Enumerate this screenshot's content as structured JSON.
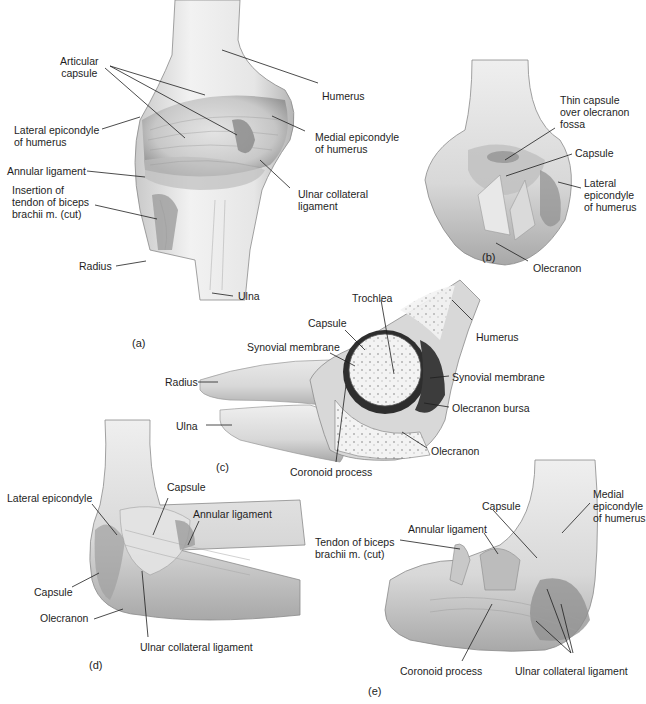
{
  "figure": {
    "panels": [
      {
        "id": "a",
        "tag": "(a)",
        "labels": [
          {
            "text": "Articular\ncapsule",
            "x": 60,
            "y": 55,
            "align": "center"
          },
          {
            "text": "Humerus",
            "x": 342,
            "y": 96
          },
          {
            "text": "Lateral epicondyle\nof humerus",
            "x": 14,
            "y": 124
          },
          {
            "text": "Medial epicondyle\nof humerus",
            "x": 315,
            "y": 114
          },
          {
            "text": "Annular ligament",
            "x": 7,
            "y": 166
          },
          {
            "text": "Insertion of\ntendon of biceps\nbrachii m. (cut)",
            "x": 12,
            "y": 183
          },
          {
            "text": "Ulnar collateral\nligament",
            "x": 298,
            "y": 183
          },
          {
            "text": "Radius",
            "x": 79,
            "y": 260
          },
          {
            "text": "Ulna",
            "x": 238,
            "y": 292
          }
        ]
      },
      {
        "id": "b",
        "tag": "(b)",
        "labels": [
          {
            "text": "Thin capsule\nover olecranon\nfossa",
            "x": 560,
            "y": 94
          },
          {
            "text": "Capsule",
            "x": 575,
            "y": 148
          },
          {
            "text": "Lateral\nepicondyle\nof humerus",
            "x": 584,
            "y": 177
          },
          {
            "text": "Olecranon",
            "x": 535,
            "y": 263
          }
        ]
      },
      {
        "id": "c",
        "tag": "(c)",
        "labels": [
          {
            "text": "Trochlea",
            "x": 352,
            "y": 292
          },
          {
            "text": "Capsule",
            "x": 308,
            "y": 316
          },
          {
            "text": "Humerus",
            "x": 476,
            "y": 331
          },
          {
            "text": "Synovial membrane",
            "x": 247,
            "y": 341
          },
          {
            "text": "Radius",
            "x": 166,
            "y": 376
          },
          {
            "text": "Synovial membrane",
            "x": 452,
            "y": 372
          },
          {
            "text": "Olecranon bursa",
            "x": 452,
            "y": 403
          },
          {
            "text": "Ulna",
            "x": 176,
            "y": 420
          },
          {
            "text": "Olecranon",
            "x": 430,
            "y": 445
          },
          {
            "text": "Coronoid process",
            "x": 290,
            "y": 466
          }
        ]
      },
      {
        "id": "d",
        "tag": "(d)",
        "labels": [
          {
            "text": "Lateral epicondyle",
            "x": 7,
            "y": 492
          },
          {
            "text": "Capsule",
            "x": 167,
            "y": 482
          },
          {
            "text": "Annular ligament",
            "x": 193,
            "y": 508
          },
          {
            "text": "Capsule",
            "x": 34,
            "y": 589
          },
          {
            "text": "Olecranon",
            "x": 40,
            "y": 613
          },
          {
            "text": "Ulnar collateral ligament",
            "x": 140,
            "y": 643
          }
        ]
      },
      {
        "id": "e",
        "tag": "(e)",
        "labels": [
          {
            "text": "Medial\nepicondyle\nof humerus",
            "x": 593,
            "y": 488
          },
          {
            "text": "Capsule",
            "x": 482,
            "y": 500
          },
          {
            "text": "Annular ligament",
            "x": 408,
            "y": 524
          },
          {
            "text": "Tendon of biceps\nbrachii m. (cut)",
            "x": 315,
            "y": 535
          },
          {
            "text": "Coronoid process",
            "x": 400,
            "y": 666
          },
          {
            "text": "Ulnar collateral ligament",
            "x": 515,
            "y": 666
          }
        ]
      }
    ]
  }
}
